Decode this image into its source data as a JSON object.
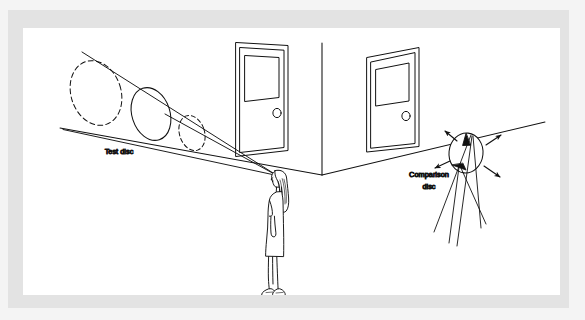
{
  "figure": {
    "labels": {
      "test_disc": "Test disc",
      "comparison_disc_line1": "Comparison",
      "comparison_disc_line2": "disc"
    },
    "colors": {
      "ink": "#111111",
      "plate": "#ffffff",
      "frame": "#e3e3e3",
      "outer_margin": "#f4f4f4"
    },
    "elements": {
      "observer": "woman standing in profile facing left",
      "left_door": "door with window panel and round knob",
      "right_door": "door with window panel and round knob",
      "test_discs": "three ellipses of decreasing size along the visual cone",
      "comparison_disc": "ellipse with four radiating arrows",
      "wall_corner": "vertical corner line where the two walls meet"
    },
    "counts": {
      "doors": 2,
      "test_disc_ellipses": 3,
      "comparison_disc_arrows": 4
    }
  }
}
